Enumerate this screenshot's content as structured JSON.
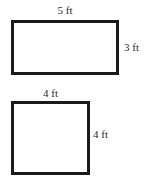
{
  "canvas": {
    "width": 152,
    "height": 182,
    "background_color": "#ffffff",
    "stroke_color": "#1a1a1a",
    "text_color": "#2b2b2b",
    "stroke_width": 3
  },
  "figures": [
    {
      "id": "rectangle",
      "shape": "rectangle",
      "labels": {
        "top": "5 ft",
        "right": "3 ft"
      },
      "dimensions": {
        "width_value": 5,
        "height_value": 3,
        "unit": "ft"
      },
      "pixel_box": {
        "x": 11,
        "y": 20,
        "width": 108,
        "height": 55
      }
    },
    {
      "id": "square",
      "shape": "square",
      "labels": {
        "top": "4 ft",
        "right": "4 ft"
      },
      "dimensions": {
        "width_value": 4,
        "height_value": 4,
        "unit": "ft"
      },
      "pixel_box": {
        "x": 11,
        "y": 101,
        "width": 79,
        "height": 74
      }
    }
  ]
}
